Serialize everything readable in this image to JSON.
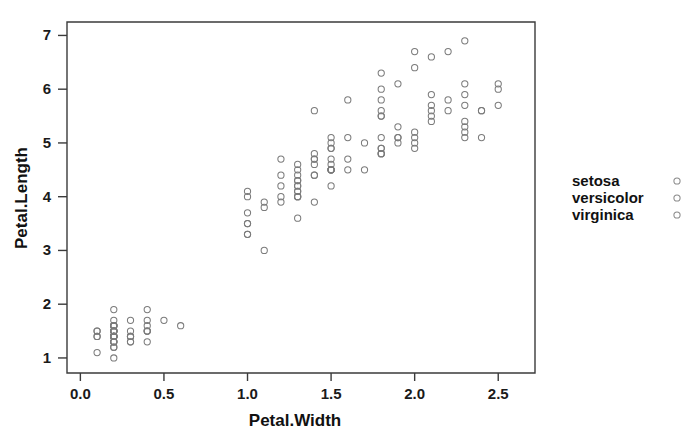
{
  "chart_data": {
    "type": "scatter",
    "title": "",
    "xlabel": "Petal.Width",
    "ylabel": "Petal.Length",
    "xlim": [
      -0.08,
      2.72
    ],
    "ylim": [
      0.72,
      7.25
    ],
    "xticks": [
      0.0,
      0.5,
      1.0,
      1.5,
      2.0,
      2.5
    ],
    "xticklabels": [
      "0.0",
      "0.5",
      "1.0",
      "1.5",
      "2.0",
      "2.5"
    ],
    "yticks": [
      1,
      2,
      3,
      4,
      5,
      6,
      7
    ],
    "yticklabels": [
      "1",
      "2",
      "3",
      "4",
      "5",
      "6",
      "7"
    ],
    "grid": false,
    "marker": "open-circle",
    "marker_color": "#7b7b7b",
    "legend_position": "right",
    "legend_entries": [
      "setosa",
      "versicolor",
      "virginica"
    ],
    "series": [
      {
        "name": "setosa",
        "x": [
          0.2,
          0.2,
          0.2,
          0.2,
          0.2,
          0.4,
          0.3,
          0.2,
          0.2,
          0.1,
          0.2,
          0.2,
          0.1,
          0.1,
          0.2,
          0.4,
          0.4,
          0.3,
          0.3,
          0.3,
          0.2,
          0.4,
          0.2,
          0.5,
          0.2,
          0.2,
          0.4,
          0.2,
          0.2,
          0.2,
          0.2,
          0.4,
          0.1,
          0.2,
          0.2,
          0.2,
          0.2,
          0.1,
          0.2,
          0.2,
          0.3,
          0.3,
          0.2,
          0.6,
          0.4,
          0.3,
          0.2,
          0.2,
          0.2,
          0.2
        ],
        "y": [
          1.4,
          1.4,
          1.3,
          1.5,
          1.4,
          1.7,
          1.4,
          1.5,
          1.4,
          1.5,
          1.5,
          1.6,
          1.4,
          1.1,
          1.2,
          1.5,
          1.3,
          1.4,
          1.7,
          1.5,
          1.7,
          1.5,
          1.0,
          1.7,
          1.9,
          1.6,
          1.6,
          1.5,
          1.4,
          1.6,
          1.6,
          1.5,
          1.5,
          1.4,
          1.5,
          1.2,
          1.3,
          1.4,
          1.3,
          1.5,
          1.3,
          1.3,
          1.3,
          1.6,
          1.9,
          1.4,
          1.6,
          1.4,
          1.5,
          1.4
        ]
      },
      {
        "name": "versicolor",
        "x": [
          1.4,
          1.5,
          1.5,
          1.3,
          1.5,
          1.3,
          1.6,
          1.0,
          1.3,
          1.4,
          1.0,
          1.5,
          1.0,
          1.4,
          1.3,
          1.4,
          1.5,
          1.0,
          1.5,
          1.1,
          1.8,
          1.3,
          1.5,
          1.2,
          1.3,
          1.4,
          1.4,
          1.7,
          1.5,
          1.0,
          1.1,
          1.0,
          1.2,
          1.6,
          1.5,
          1.6,
          1.5,
          1.3,
          1.3,
          1.3,
          1.2,
          1.4,
          1.2,
          1.0,
          1.3,
          1.2,
          1.3,
          1.3,
          1.1,
          1.3
        ],
        "y": [
          4.7,
          4.5,
          4.9,
          4.0,
          4.6,
          4.5,
          4.7,
          3.3,
          4.6,
          3.9,
          3.5,
          4.2,
          4.0,
          4.7,
          3.6,
          4.4,
          4.5,
          4.1,
          4.5,
          3.9,
          4.8,
          4.0,
          4.9,
          4.7,
          4.3,
          4.4,
          4.8,
          5.0,
          4.5,
          3.5,
          3.8,
          3.7,
          3.9,
          5.1,
          4.5,
          4.5,
          4.7,
          4.4,
          4.1,
          4.0,
          4.4,
          4.6,
          4.0,
          3.3,
          4.2,
          4.2,
          4.2,
          4.3,
          3.0,
          4.1
        ]
      },
      {
        "name": "virginica",
        "x": [
          2.5,
          1.9,
          2.1,
          1.8,
          2.2,
          2.1,
          1.7,
          1.8,
          1.8,
          2.5,
          2.0,
          1.9,
          2.1,
          2.0,
          2.4,
          2.3,
          1.8,
          2.2,
          2.3,
          1.5,
          2.3,
          2.0,
          2.0,
          1.8,
          2.1,
          1.8,
          1.8,
          1.8,
          2.1,
          1.6,
          1.9,
          2.0,
          2.2,
          1.5,
          1.4,
          2.3,
          2.4,
          1.8,
          1.8,
          2.1,
          2.4,
          2.3,
          1.9,
          2.3,
          2.5,
          2.3,
          1.9,
          2.0,
          2.3,
          1.8
        ],
        "y": [
          6.0,
          5.1,
          5.9,
          5.6,
          5.8,
          6.6,
          4.5,
          6.3,
          5.8,
          6.1,
          5.1,
          5.3,
          5.5,
          5.0,
          5.1,
          5.3,
          5.5,
          6.7,
          6.9,
          5.0,
          5.7,
          4.9,
          6.7,
          4.9,
          5.7,
          6.0,
          4.8,
          4.9,
          5.6,
          5.8,
          6.1,
          6.4,
          5.6,
          5.1,
          5.6,
          6.1,
          5.6,
          5.5,
          4.8,
          5.4,
          5.6,
          5.1,
          5.1,
          5.9,
          5.7,
          5.2,
          5.0,
          5.2,
          5.4,
          5.1
        ]
      }
    ]
  },
  "legend": {
    "items": [
      {
        "label": "setosa",
        "marker": "open-circle"
      },
      {
        "label": "versicolor",
        "marker": "open-circle"
      },
      {
        "label": "virginica",
        "marker": "open-circle"
      }
    ]
  }
}
